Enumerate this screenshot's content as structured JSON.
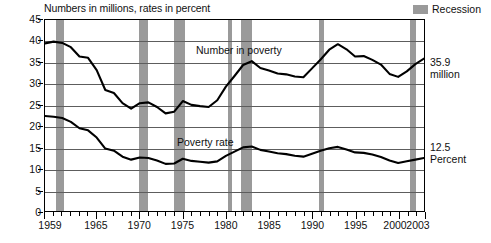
{
  "header": {
    "subtitle": "Numbers in millions, rates in percent",
    "legend_label": "Recession",
    "legend_color": "#9a9a9a"
  },
  "annotations": {
    "poverty_number_label": "Number in poverty",
    "poverty_rate_label": "Poverty rate",
    "right_number_value": "35.9",
    "right_number_unit": "million",
    "right_rate_value": "12.5",
    "right_rate_unit": "Percent"
  },
  "chart_data": {
    "type": "line",
    "title": "",
    "subtitle": "Numbers in millions, rates in percent",
    "xlabel": "",
    "ylabel": "",
    "xlim": [
      1959,
      2003
    ],
    "ylim": [
      0,
      45
    ],
    "grid": true,
    "legend_position": "top-right",
    "ytick_labels": [
      "0",
      "5",
      "10",
      "15",
      "20",
      "25",
      "30",
      "35",
      "40",
      "45"
    ],
    "ytick_values": [
      0,
      5,
      10,
      15,
      20,
      25,
      30,
      35,
      40,
      45
    ],
    "xtick_labels": [
      "1959",
      "1965",
      "1970",
      "1975",
      "1980",
      "1985",
      "1990",
      "1995",
      "2000",
      "2003"
    ],
    "xtick_values": [
      1959,
      1965,
      1970,
      1975,
      1980,
      1985,
      1990,
      1995,
      2000,
      2003
    ],
    "x": [
      1959,
      1960,
      1961,
      1962,
      1963,
      1964,
      1965,
      1966,
      1967,
      1968,
      1969,
      1970,
      1971,
      1972,
      1973,
      1974,
      1975,
      1976,
      1977,
      1978,
      1979,
      1980,
      1981,
      1982,
      1983,
      1984,
      1985,
      1986,
      1987,
      1988,
      1989,
      1990,
      1991,
      1992,
      1993,
      1994,
      1995,
      1996,
      1997,
      1998,
      1999,
      2000,
      2001,
      2002,
      2003
    ],
    "series": [
      {
        "name": "Number in poverty",
        "unit": "millions",
        "end_label": "35.9 million",
        "values": [
          39.5,
          39.9,
          39.6,
          38.6,
          36.4,
          36.1,
          33.2,
          28.5,
          27.8,
          25.4,
          24.1,
          25.4,
          25.6,
          24.5,
          23.0,
          23.4,
          25.9,
          25.0,
          24.7,
          24.5,
          26.1,
          29.3,
          31.8,
          34.4,
          35.3,
          33.7,
          33.1,
          32.4,
          32.2,
          31.7,
          31.5,
          33.6,
          35.7,
          38.0,
          39.3,
          38.1,
          36.4,
          36.5,
          35.6,
          34.5,
          32.3,
          31.6,
          32.9,
          34.6,
          35.9
        ]
      },
      {
        "name": "Poverty rate",
        "unit": "percent",
        "end_label": "12.5 Percent",
        "values": [
          22.4,
          22.2,
          21.9,
          21.0,
          19.5,
          19.0,
          17.3,
          14.7,
          14.2,
          12.8,
          12.1,
          12.6,
          12.5,
          11.9,
          11.1,
          11.2,
          12.3,
          11.8,
          11.6,
          11.4,
          11.7,
          13.0,
          14.0,
          15.0,
          15.2,
          14.4,
          14.0,
          13.6,
          13.4,
          13.0,
          12.8,
          13.5,
          14.2,
          14.8,
          15.1,
          14.5,
          13.8,
          13.7,
          13.3,
          12.7,
          11.9,
          11.3,
          11.7,
          12.1,
          12.5
        ]
      }
    ],
    "recessions": [
      {
        "start": 1960.3,
        "end": 1961.2
      },
      {
        "start": 1969.9,
        "end": 1970.9
      },
      {
        "start": 1973.9,
        "end": 1975.2
      },
      {
        "start": 1980.1,
        "end": 1980.6
      },
      {
        "start": 1981.6,
        "end": 1982.9
      },
      {
        "start": 1990.6,
        "end": 1991.2
      },
      {
        "start": 2001.2,
        "end": 2001.9
      }
    ]
  }
}
